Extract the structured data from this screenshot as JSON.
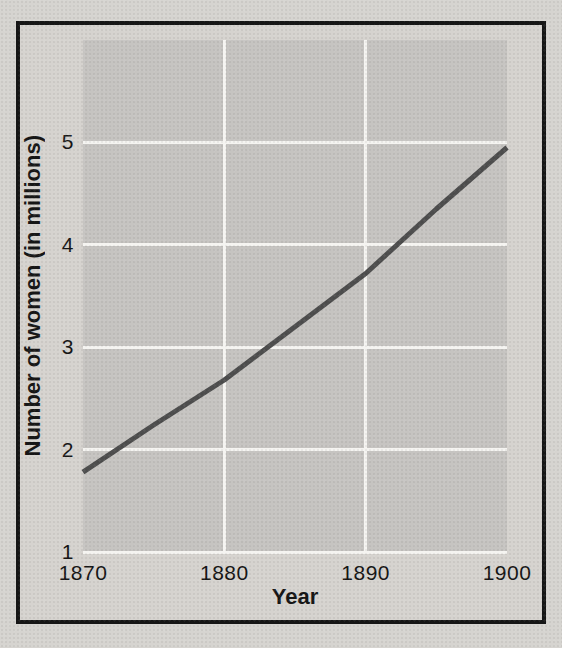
{
  "chart_data": {
    "type": "line",
    "title": "",
    "xlabel": "Year",
    "ylabel": "Number of women (in millions)",
    "x": [
      1870,
      1875,
      1880,
      1885,
      1890,
      1895,
      1900
    ],
    "y": [
      1.78,
      2.24,
      2.68,
      3.2,
      3.72,
      4.35,
      4.95
    ],
    "x_tick_values": [
      1870,
      1880,
      1890,
      1900
    ],
    "x_tick_labels": [
      "1870",
      "1880",
      "1890",
      "1900"
    ],
    "y_tick_values": [
      1,
      2,
      3,
      4,
      5
    ],
    "y_tick_labels": [
      "1",
      "2",
      "3",
      "4",
      "5"
    ],
    "xlim": [
      1870,
      1900
    ],
    "ylim": [
      1,
      6
    ],
    "grid": true,
    "vertical_gridlines_at": [
      1880,
      1890
    ],
    "horizontal_gridlines_at": [
      1,
      2,
      3,
      4,
      5
    ],
    "legend_position": "none",
    "line_color": "#4e4e4e",
    "line_width_px": 5,
    "plot_background": "#c6c4c1",
    "gridline_color": "#f5f4f1",
    "frame_border_color": "#161616",
    "page_background": "#d6d4d0",
    "text_color": "#161616"
  }
}
